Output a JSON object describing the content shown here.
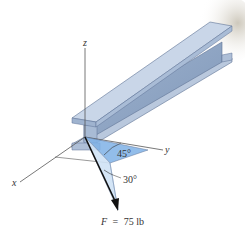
{
  "diagram": {
    "type": "3d-force-vector",
    "object": "I-beam (wide flange)",
    "axes": {
      "x_label": "x",
      "y_label": "y",
      "z_label": "z"
    },
    "angles": {
      "horizontal_angle_label": "45°",
      "vertical_angle_label": "30°"
    },
    "force": {
      "symbol": "F",
      "equals": "=",
      "magnitude": "75 lb",
      "full_label": "F = 75 lb"
    },
    "colors": {
      "beam_light": "#c9d6e8",
      "beam_mid": "#a9bcd6",
      "beam_dark": "#8ea4c3",
      "beam_edge": "#5f7396",
      "plane_fill": "#7fb2e6",
      "plane_light": "#cfe2f5",
      "force_arrow": "#111111",
      "axis_line": "#555555"
    }
  }
}
